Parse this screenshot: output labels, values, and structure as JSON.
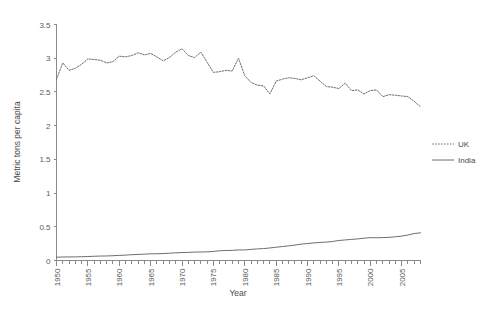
{
  "chart_data": {
    "type": "line",
    "title": "",
    "xlabel": "Year",
    "ylabel": "Metric tons per capita",
    "xlim": [
      1950,
      2008
    ],
    "ylim": [
      0,
      3.5
    ],
    "grid": false,
    "legend_position": "right",
    "y_ticks": [
      "0",
      "0.5",
      "1",
      "1.5",
      "2",
      "2.5",
      "3",
      "3.5"
    ],
    "y_tick_values": [
      0,
      0.5,
      1,
      1.5,
      2,
      2.5,
      3,
      3.5
    ],
    "x_ticks": [
      "1950",
      "1955",
      "1960",
      "1965",
      "1970",
      "1975",
      "1980",
      "1985",
      "1990",
      "1995",
      "2000",
      "2005"
    ],
    "x_tick_values": [
      1950,
      1955,
      1960,
      1965,
      1970,
      1975,
      1980,
      1985,
      1990,
      1995,
      2000,
      2005
    ],
    "x": [
      1950,
      1951,
      1952,
      1953,
      1954,
      1955,
      1956,
      1957,
      1958,
      1959,
      1960,
      1961,
      1962,
      1963,
      1964,
      1965,
      1966,
      1967,
      1968,
      1969,
      1970,
      1971,
      1972,
      1973,
      1974,
      1975,
      1976,
      1977,
      1978,
      1979,
      1980,
      1981,
      1982,
      1983,
      1984,
      1985,
      1986,
      1987,
      1988,
      1989,
      1990,
      1991,
      1992,
      1993,
      1994,
      1995,
      1996,
      1997,
      1998,
      1999,
      2000,
      2001,
      2002,
      2003,
      2004,
      2005,
      2006,
      2007,
      2008
    ],
    "series": [
      {
        "name": "UK",
        "style": "dotted",
        "color": "#6e6e6e",
        "values": [
          2.69,
          2.93,
          2.82,
          2.85,
          2.91,
          2.99,
          2.98,
          2.97,
          2.93,
          2.95,
          3.03,
          3.02,
          3.04,
          3.08,
          3.05,
          3.07,
          3.02,
          2.96,
          3.01,
          3.09,
          3.14,
          3.04,
          3.01,
          3.09,
          2.94,
          2.79,
          2.8,
          2.82,
          2.81,
          3.0,
          2.74,
          2.64,
          2.6,
          2.59,
          2.47,
          2.66,
          2.69,
          2.71,
          2.7,
          2.68,
          2.71,
          2.74,
          2.66,
          2.58,
          2.57,
          2.55,
          2.63,
          2.52,
          2.53,
          2.47,
          2.52,
          2.53,
          2.43,
          2.46,
          2.45,
          2.44,
          2.43,
          2.36,
          2.28
        ]
      },
      {
        "name": "India",
        "style": "solid",
        "color": "#6e6e6e",
        "values": [
          0.049,
          0.052,
          0.053,
          0.054,
          0.056,
          0.059,
          0.063,
          0.066,
          0.067,
          0.071,
          0.076,
          0.08,
          0.086,
          0.09,
          0.094,
          0.099,
          0.1,
          0.103,
          0.108,
          0.114,
          0.118,
          0.12,
          0.125,
          0.126,
          0.128,
          0.135,
          0.145,
          0.148,
          0.15,
          0.157,
          0.156,
          0.165,
          0.172,
          0.177,
          0.186,
          0.197,
          0.207,
          0.217,
          0.229,
          0.243,
          0.252,
          0.261,
          0.268,
          0.273,
          0.282,
          0.297,
          0.305,
          0.313,
          0.32,
          0.331,
          0.339,
          0.337,
          0.34,
          0.343,
          0.352,
          0.362,
          0.378,
          0.4,
          0.41
        ]
      }
    ]
  },
  "legend": {
    "items": [
      {
        "label": "UK"
      },
      {
        "label": "India"
      }
    ]
  }
}
